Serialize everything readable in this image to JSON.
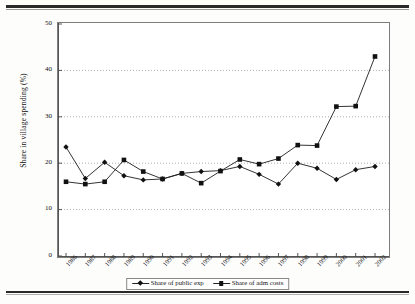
{
  "figure": {
    "y_axis_title": "Share in village spending (%)",
    "y_ticks": [
      "0",
      "10",
      "20",
      "30",
      "40",
      "50"
    ]
  },
  "legend": {
    "items": [
      {
        "label": "Share of public exp",
        "marker": "diamond-marker-icon"
      },
      {
        "label": "Share of adm costs",
        "marker": "square-marker-icon"
      }
    ]
  },
  "chart_data": {
    "type": "line",
    "title": "",
    "xlabel": "",
    "ylabel": "Share in village spending (%)",
    "ylim": [
      0,
      50
    ],
    "yticks": [
      0,
      10,
      20,
      30,
      40,
      50
    ],
    "grid": "horizontal-dotted",
    "legend_position": "bottom-center",
    "categories": [
      "1986",
      "1987",
      "1988",
      "1989",
      "1990",
      "1991",
      "1992",
      "1993",
      "1994",
      "1995",
      "1996",
      "1997",
      "1998",
      "1999",
      "2000",
      "2001",
      "2002"
    ],
    "series": [
      {
        "name": "Share of public exp",
        "marker": "diamond",
        "values": [
          23.5,
          16.7,
          20.2,
          17.3,
          16.4,
          16.6,
          17.8,
          18.2,
          18.4,
          19.3,
          17.6,
          15.5,
          20.0,
          18.9,
          16.5,
          18.6,
          19.3
        ]
      },
      {
        "name": "Share of adm costs",
        "marker": "square",
        "values": [
          16.0,
          15.5,
          16.0,
          20.7,
          18.2,
          16.6,
          17.8,
          15.7,
          18.3,
          20.8,
          19.8,
          21.0,
          23.9,
          23.8,
          32.2,
          32.3,
          43.0
        ]
      }
    ]
  }
}
